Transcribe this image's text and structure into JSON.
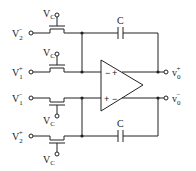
{
  "diagram": {
    "type": "fully-differential MOSFET-C integrator",
    "inputs": [
      {
        "id": "in1",
        "base": "V",
        "sub": "2",
        "sup": "−"
      },
      {
        "id": "in2",
        "base": "V",
        "sub": "1",
        "sup": "+"
      },
      {
        "id": "in3",
        "base": "V",
        "sub": "1",
        "sup": "−"
      },
      {
        "id": "in4",
        "base": "V",
        "sub": "2",
        "sup": "+"
      }
    ],
    "gate_labels": [
      {
        "base": "V",
        "sub": "C"
      },
      {
        "base": "V",
        "sub": "C"
      },
      {
        "base": "V",
        "sub": "C"
      },
      {
        "base": "V",
        "sub": "C"
      }
    ],
    "capacitors": [
      {
        "label": "C"
      },
      {
        "label": "C"
      }
    ],
    "opamp": {
      "input_top_signs": {
        "left": "−",
        "right": "+"
      },
      "input_bottom_signs": {
        "left": "+",
        "right": "−"
      }
    },
    "outputs": [
      {
        "id": "out_pos",
        "base": "v",
        "sub": "0",
        "sup": "+"
      },
      {
        "id": "out_neg",
        "base": "v",
        "sub": "0",
        "sup": "−"
      }
    ]
  }
}
